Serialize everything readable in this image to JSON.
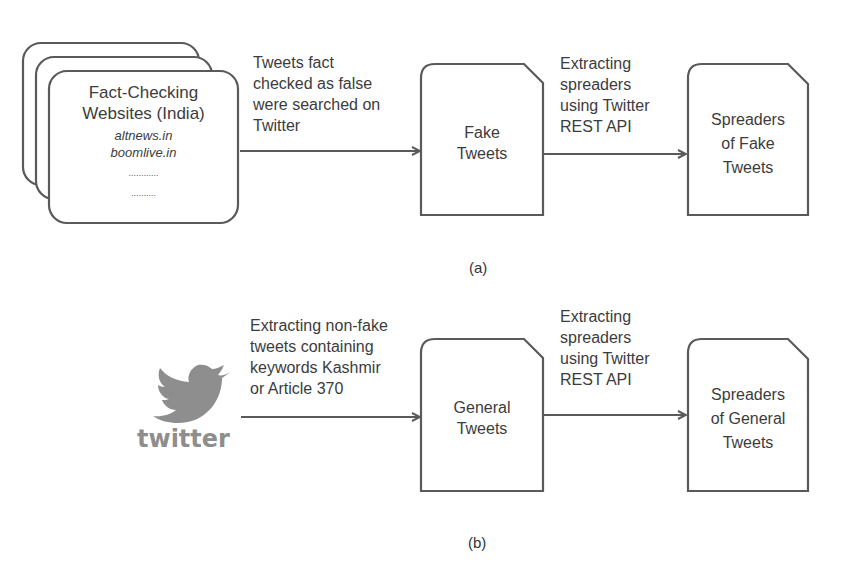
{
  "panel_a": {
    "caption": "(a)",
    "source": {
      "title_line1": "Fact-Checking",
      "title_line2": "Websites (India)",
      "site1": "altnews.in",
      "site2": "boomlive.in",
      "ellipsis1": "............",
      "ellipsis2": ".........."
    },
    "edge1": {
      "line1": "Tweets fact",
      "line2": "checked as false",
      "line3": "were searched on",
      "line4": "Twitter"
    },
    "node1": {
      "line1": "Fake",
      "line2": "Tweets"
    },
    "edge2": {
      "line1": "Extracting",
      "line2": "spreaders",
      "line3": "using Twitter",
      "line4": "REST API"
    },
    "node2": {
      "line1": "Spreaders",
      "line2": "of Fake",
      "line3": "Tweets"
    }
  },
  "panel_b": {
    "caption": "(b)",
    "source": {
      "icon": "twitter-bird-icon",
      "wordmark": "twitter"
    },
    "edge1": {
      "line1": "Extracting non-fake",
      "line2": "tweets containing",
      "line3": "keywords Kashmir",
      "line4": "or Article 370"
    },
    "node1": {
      "line1": "General",
      "line2": "Tweets"
    },
    "edge2": {
      "line1": "Extracting",
      "line2": "spreaders",
      "line3": "using Twitter",
      "line4": "REST API"
    },
    "node2": {
      "line1": "Spreaders",
      "line2": "of General",
      "line3": "Tweets"
    }
  },
  "colors": {
    "stroke": "#5a5a5a",
    "text": "#3c3c3c",
    "twitter_gray": "#8e8e8e"
  }
}
